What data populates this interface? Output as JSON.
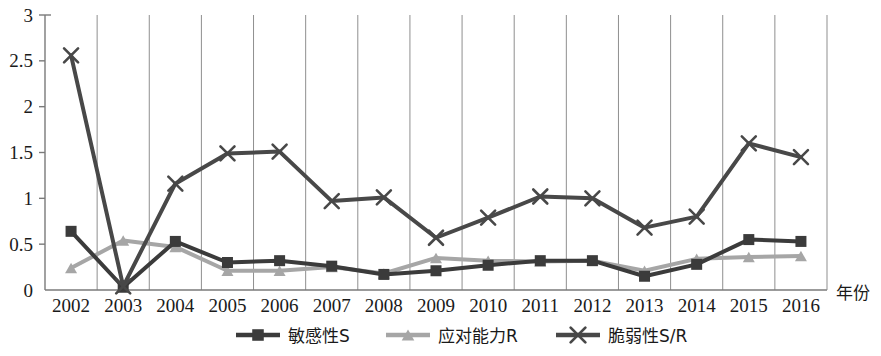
{
  "chart_data": {
    "type": "line",
    "title": "",
    "xlabel": "年份",
    "ylabel": "",
    "x": [
      "2002",
      "2003",
      "2004",
      "2005",
      "2006",
      "2007",
      "2008",
      "2009",
      "2010",
      "2011",
      "2012",
      "2013",
      "2014",
      "2015",
      "2016"
    ],
    "categories": [
      "2002",
      "2003",
      "2004",
      "2005",
      "2006",
      "2007",
      "2008",
      "2009",
      "2010",
      "2011",
      "2012",
      "2013",
      "2014",
      "2015",
      "2016"
    ],
    "ylim": [
      0,
      3
    ],
    "yticks": [
      0,
      0.5,
      1,
      1.5,
      2,
      2.5,
      3
    ],
    "ytick_labels": [
      "0",
      "0.5",
      "1",
      "1.5",
      "2",
      "2.5",
      "3"
    ],
    "grid": "vertical",
    "legend_position": "bottom",
    "series": [
      {
        "name": "敏感性S",
        "marker": "square",
        "color": "#3b3b3b",
        "values": [
          0.64,
          0.03,
          0.53,
          0.3,
          0.32,
          0.26,
          0.17,
          0.21,
          0.27,
          0.32,
          0.32,
          0.15,
          0.28,
          0.55,
          0.53
        ]
      },
      {
        "name": "应对能力R",
        "marker": "triangle",
        "color": "#a6a6a6",
        "values": [
          0.24,
          0.54,
          0.47,
          0.21,
          0.21,
          0.25,
          0.18,
          0.35,
          0.32,
          0.31,
          0.32,
          0.21,
          0.34,
          0.36,
          0.37
        ]
      },
      {
        "name": "脆弱性S/R",
        "marker": "x",
        "color": "#484848",
        "values": [
          2.56,
          0.04,
          1.16,
          1.49,
          1.51,
          0.97,
          1.01,
          0.57,
          0.79,
          1.02,
          1.0,
          0.68,
          0.8,
          1.6,
          1.45
        ]
      }
    ]
  },
  "legend": {
    "items": [
      {
        "label": "敏感性S",
        "marker": "square",
        "color": "#3b3b3b"
      },
      {
        "label": "应对能力R",
        "marker": "triangle",
        "color": "#a6a6a6"
      },
      {
        "label": "脆弱性S/R",
        "marker": "x",
        "color": "#484848"
      }
    ]
  },
  "axis": {
    "x_axis_title": "年份"
  }
}
